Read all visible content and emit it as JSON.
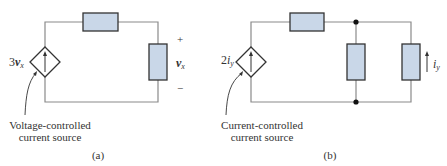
{
  "figure_a": {
    "source_label_coef": "3",
    "source_label_var": "v",
    "source_label_sub": "x",
    "plus": "+",
    "minus": "−",
    "voltage_var": "v",
    "voltage_sub": "x",
    "caption_line1": "Voltage-controlled",
    "caption_line2": "current source",
    "panel_label": "(a)"
  },
  "figure_b": {
    "source_label_coef": "2",
    "source_label_var": "i",
    "source_label_sub": "y",
    "current_var": "i",
    "current_sub": "y",
    "caption_line1": "Current-controlled",
    "caption_line2": "current source",
    "panel_label": "(b)"
  },
  "colors": {
    "wire": "#8a8a8a",
    "resistor_fill": "#c9d7e8",
    "resistor_stroke": "#333333",
    "text": "#333333"
  }
}
